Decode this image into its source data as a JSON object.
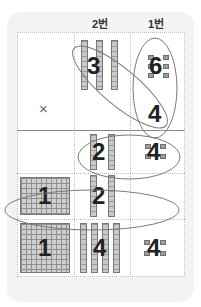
{
  "headers": {
    "col_tens": "2번",
    "col_ones": "1번"
  },
  "problem": {
    "multiplicand": {
      "tens": "3",
      "ones": "6"
    },
    "operator": "×",
    "multiplier": {
      "ones": "4"
    }
  },
  "partial_products": [
    {
      "row": "ones×ones",
      "tens": "2",
      "ones": "4"
    },
    {
      "row": "tens×ones",
      "hundreds": "1",
      "tens": "2"
    }
  ],
  "result": {
    "hundreds": "1",
    "tens": "4",
    "ones": "4"
  },
  "colors": {
    "card_bg": "#f3f3f3",
    "grid_line": "#bdbdbd",
    "block": "#a0a0a0",
    "ellipse": "#777777",
    "text": "#222222"
  }
}
